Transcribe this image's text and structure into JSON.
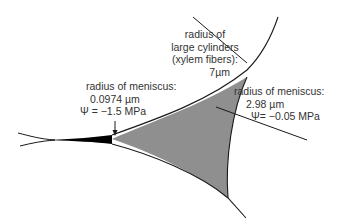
{
  "diagram": {
    "colors": {
      "line": "#1a1a1a",
      "fill_gray": "#8f8f8f",
      "wedge_black": "#000000",
      "text": "#333333",
      "background": "#ffffff"
    },
    "labels": {
      "large_cylinder": {
        "line1": "radius of",
        "line2": "large cylinders",
        "line3": "(xylem fibers):",
        "value": "7µm"
      },
      "small_meniscus": {
        "line1": "radius of meniscus:",
        "radius": "0.0974 µm",
        "psi": "Ψ =  −1.5 MPa"
      },
      "large_meniscus": {
        "line1": "radius of meniscus:",
        "radius": "2.98 µm",
        "psi": "Ψ=  −0.05 MPa"
      }
    }
  }
}
